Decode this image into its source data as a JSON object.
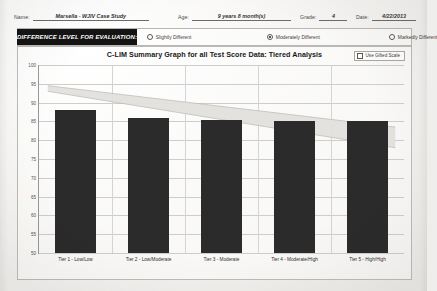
{
  "form": {
    "fields": [
      {
        "label": "Name:",
        "value": "Marsella - WJIV Case Study"
      },
      {
        "label": "Age:",
        "value": "9 years 8 month(s)"
      },
      {
        "label": "Grade:",
        "value": "4"
      },
      {
        "label": "Date:",
        "value": "4/22/2013"
      }
    ]
  },
  "difference_level": {
    "banner_label": "DIFFERENCE LEVEL FOR EVALUATION:",
    "options": [
      {
        "label": "Slightly Different",
        "selected": false
      },
      {
        "label": "Moderately Different",
        "selected": true
      },
      {
        "label": "Markedly Different",
        "selected": false
      }
    ]
  },
  "chart_panel": {
    "gifted_checkbox": {
      "label": "Use Gifted Scale",
      "checked": false
    }
  },
  "colors": {
    "bar": "#2b2b2b",
    "band": "#e2e0dd",
    "banner": "#141414",
    "grid": "#cfcdca",
    "axis": "#9b9996",
    "paper": "#f4f3f1"
  },
  "chart_data": {
    "type": "bar",
    "title": "C-LIM Summary Graph for all Test Score Data: Tiered Analysis",
    "xlabel": "",
    "ylabel": "",
    "ylim": [
      50,
      100
    ],
    "yticks": [
      50,
      55,
      60,
      65,
      70,
      75,
      80,
      85,
      90,
      95,
      100
    ],
    "grid": true,
    "legend": "none",
    "categories": [
      "Tier 1 - Low/Low",
      "Tier 2 - Low/Moderate",
      "Tier 3 - Moderate",
      "Tier 4 - Moderate/High",
      "Tier 5 - High/High"
    ],
    "values": [
      88,
      86,
      85.5,
      85,
      85
    ],
    "bands": [
      {
        "name": "Expected range upper bound",
        "start_value": 94.5,
        "end_value": 83.5
      },
      {
        "name": "Expected range lower bound",
        "start_value": 93.0,
        "end_value": 78.0
      }
    ]
  }
}
